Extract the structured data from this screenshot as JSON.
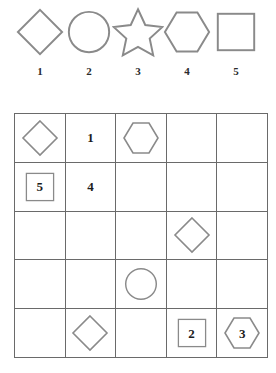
{
  "legend": {
    "items": [
      {
        "shape": "diamond-icon",
        "label": "1"
      },
      {
        "shape": "circle-icon",
        "label": "2"
      },
      {
        "shape": "star-icon",
        "label": "3"
      },
      {
        "shape": "hexagon-icon",
        "label": "4"
      },
      {
        "shape": "square-icon",
        "label": "5"
      }
    ]
  },
  "grid": {
    "rows": 5,
    "cols": 5,
    "cells": [
      [
        {
          "shape": "diamond-icon",
          "value": ""
        },
        {
          "shape": "none",
          "value": "1"
        },
        {
          "shape": "hexagon-icon",
          "value": ""
        },
        {
          "shape": "none",
          "value": ""
        },
        {
          "shape": "none",
          "value": ""
        }
      ],
      [
        {
          "shape": "square-icon",
          "value": "5"
        },
        {
          "shape": "none",
          "value": "4"
        },
        {
          "shape": "none",
          "value": ""
        },
        {
          "shape": "none",
          "value": ""
        },
        {
          "shape": "none",
          "value": ""
        }
      ],
      [
        {
          "shape": "none",
          "value": ""
        },
        {
          "shape": "none",
          "value": ""
        },
        {
          "shape": "none",
          "value": ""
        },
        {
          "shape": "diamond-icon",
          "value": ""
        },
        {
          "shape": "none",
          "value": ""
        }
      ],
      [
        {
          "shape": "none",
          "value": ""
        },
        {
          "shape": "none",
          "value": ""
        },
        {
          "shape": "circle-icon",
          "value": ""
        },
        {
          "shape": "none",
          "value": ""
        },
        {
          "shape": "none",
          "value": ""
        }
      ],
      [
        {
          "shape": "none",
          "value": ""
        },
        {
          "shape": "diamond-icon",
          "value": ""
        },
        {
          "shape": "none",
          "value": ""
        },
        {
          "shape": "square-icon",
          "value": "2"
        },
        {
          "shape": "hexagon-icon",
          "value": "3"
        }
      ]
    ]
  },
  "colors": {
    "grid_line": "#6a6a6a",
    "shape_stroke": "#8a8a8a",
    "text": "#1c1c1c",
    "background": "#ffffff"
  }
}
